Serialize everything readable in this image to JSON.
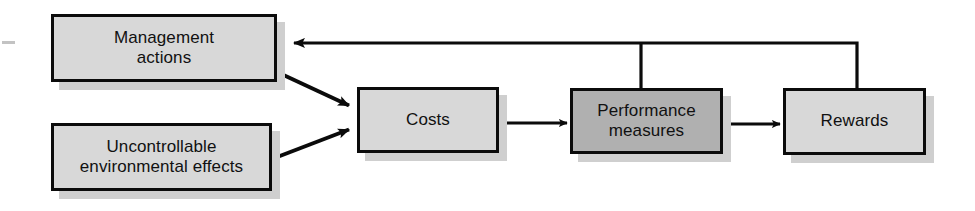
{
  "figure": {
    "kind": "flow-diagram",
    "background_color": "#ffffff",
    "line_color": "#0b0b0b",
    "node_fill_default": "#d8d8d8",
    "node_fill_highlight": "#b0b0b0",
    "node_border_color": "#0b0b0b",
    "shadow_color": "#cfcfcf"
  },
  "nodes": [
    {
      "id": "management-actions",
      "label": "Management\nactions",
      "x": 51,
      "y": 14,
      "w": 226,
      "h": 68,
      "font_size": 17,
      "fill": "#d8d8d8"
    },
    {
      "id": "uncontrollable-environmental-effects",
      "label": "Uncontrollable\nenvironmental effects",
      "x": 51,
      "y": 123,
      "w": 221,
      "h": 68,
      "font_size": 17,
      "fill": "#d8d8d8"
    },
    {
      "id": "costs",
      "label": "Costs",
      "x": 357,
      "y": 87,
      "w": 142,
      "h": 66,
      "font_size": 17,
      "fill": "#d8d8d8"
    },
    {
      "id": "performance-measures",
      "label": "Performance\nmeasures",
      "x": 570,
      "y": 88,
      "w": 153,
      "h": 66,
      "font_size": 17,
      "fill": "#b0b0b0"
    },
    {
      "id": "rewards",
      "label": "Rewards",
      "x": 783,
      "y": 88,
      "w": 143,
      "h": 67,
      "font_size": 17,
      "fill": "#d8d8d8"
    }
  ],
  "edges": [
    {
      "id": "management-actions-to-costs",
      "from": "management-actions",
      "to": "costs",
      "type": "diagonal-arrow",
      "points": "277,72 352,107",
      "arrowhead": true
    },
    {
      "id": "uncontrollable-effects-to-costs",
      "from": "uncontrollable-environmental-effects",
      "to": "costs",
      "type": "diagonal-arrow",
      "points": "272,159 352,128",
      "arrowhead": true
    },
    {
      "id": "costs-to-performance-measures",
      "from": "costs",
      "to": "performance-measures",
      "type": "straight-arrow",
      "points": "500,123 565,123",
      "arrowhead": true
    },
    {
      "id": "performance-measures-to-rewards",
      "from": "performance-measures",
      "to": "rewards",
      "type": "straight-arrow",
      "points": "724,124 778,124",
      "arrowhead": true
    },
    {
      "id": "rewards-feedback-to-management-actions",
      "from": "rewards",
      "to": "management-actions",
      "type": "orthogonal-feedback-arrow",
      "points": "857,88 857,43 292,43",
      "arrowhead": true
    },
    {
      "id": "feedback-branch-to-performance-measures",
      "from": "rewards-feedback-to-management-actions",
      "to": "performance-measures",
      "type": "branch-line",
      "points": "641,43 641,88",
      "arrowhead": false
    }
  ],
  "artifact": {
    "name": "scan-dash-mark",
    "x": 2,
    "y": 41,
    "w": 13,
    "h": 3
  }
}
